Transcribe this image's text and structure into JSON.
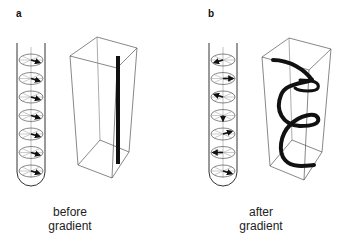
{
  "panels": [
    {
      "label": "a",
      "caption_line1": "before",
      "caption_line2": "gradient",
      "spin_arrow_angles_deg": [
        30,
        30,
        30,
        30,
        30,
        30,
        30
      ],
      "magnetization": "straight vertical bar"
    },
    {
      "label": "b",
      "caption_line1": "after",
      "caption_line2": "gradient",
      "spin_arrow_angles_deg": [
        150,
        0,
        210,
        90,
        330,
        180,
        30
      ],
      "magnetization": "helix"
    }
  ]
}
